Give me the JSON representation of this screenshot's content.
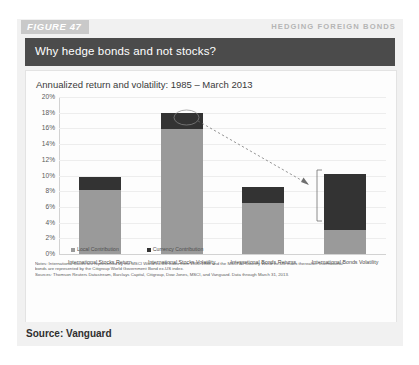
{
  "figure": {
    "tag": "FIGURE 47",
    "header_right": "HEDGING FOREIGN BONDS",
    "title": "Why hedge bonds and not stocks?",
    "source": "Source: Vanguard"
  },
  "notes": {
    "line1": "Notes: International stocks are represented by the MSCI World ex-US Index from 1985-1988 and the MSCI All Country World ex-US Index thereafter. International",
    "line2": "bonds are represented by the Citigroup World Government Bond ex-US index.",
    "line3": "Sources: Thomson Reuters Datastream, Barclays Capital, Citigroup, Dow Jones, MSCI, and Vanguard. Data through March 31, 2013."
  },
  "chart_data": {
    "type": "bar",
    "title": "Annualized return and volatility: 1985 – March 2013",
    "xlabel": "",
    "ylabel": "",
    "ylim": [
      0,
      20
    ],
    "ytick_labels": [
      "20%",
      "18%",
      "16%",
      "14%",
      "12%",
      "10%",
      "8%",
      "6%",
      "4%",
      "2%",
      "0%"
    ],
    "ytick_values": [
      20,
      18,
      16,
      14,
      12,
      10,
      8,
      6,
      4,
      2,
      0
    ],
    "grid": true,
    "stacked": true,
    "legend_position": "bottom-left",
    "categories": [
      "International Stocks Return",
      "International Stocks Volatility",
      "International Bonds Returns",
      "International Bonds Volatility"
    ],
    "series": [
      {
        "name": "Local Contribution",
        "color": "#9a9a9a",
        "values": [
          8.2,
          15.9,
          6.5,
          3.0
        ]
      },
      {
        "name": "Currency Contribution",
        "color": "#333333",
        "values": [
          1.6,
          2.1,
          2.0,
          7.2
        ]
      }
    ],
    "totals": [
      9.8,
      18.0,
      8.5,
      10.2
    ],
    "annotations": [
      {
        "type": "ellipse-callout",
        "note": "currency contribution on stocks volatility"
      },
      {
        "type": "arrow",
        "note": "points from stocks volatility currency segment to bonds volatility bracket"
      },
      {
        "type": "bracket",
        "note": "brackets currency contribution on bonds volatility"
      }
    ]
  }
}
